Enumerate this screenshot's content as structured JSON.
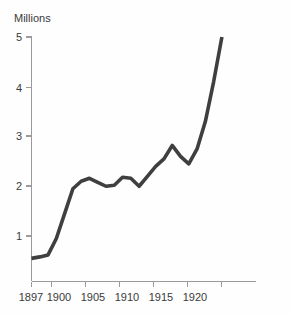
{
  "chart_data": {
    "type": "line",
    "title": "",
    "subtitle": "",
    "xlabel": "",
    "ylabel": "Millions",
    "xlim": [
      1897,
      1923
    ],
    "ylim": [
      0,
      5.4
    ],
    "grid": false,
    "legend": null,
    "line_color": "#3f3f3f",
    "axis_color": "#9a9a9a",
    "background_color": "#fefefe",
    "xticks": [
      1897,
      1900,
      1905,
      1910,
      1915,
      1920
    ],
    "xtick_labels": [
      "1897",
      "1900",
      "1905",
      "1910",
      "1915",
      "1920"
    ],
    "yticks": [
      1,
      2,
      3,
      4,
      5
    ],
    "ytick_labels": [
      "1",
      "2",
      "3",
      "4",
      "5"
    ],
    "x": [
      1897,
      1898,
      1899,
      1900,
      1901,
      1902,
      1903,
      1904,
      1905,
      1906,
      1907,
      1908,
      1909,
      1910,
      1911,
      1912,
      1913,
      1914,
      1915,
      1916,
      1917,
      1918,
      1919,
      1920
    ],
    "values": [
      0.55,
      0.58,
      0.62,
      0.95,
      1.45,
      1.95,
      2.1,
      2.16,
      2.08,
      2.0,
      2.02,
      2.18,
      2.16,
      2.0,
      2.2,
      2.4,
      2.55,
      2.82,
      2.6,
      2.45,
      2.75,
      3.3,
      4.1,
      5.0
    ],
    "series": [
      {
        "name": "Millions",
        "values": [
          0.55,
          0.58,
          0.62,
          0.95,
          1.45,
          1.95,
          2.1,
          2.16,
          2.08,
          2.0,
          2.02,
          2.18,
          2.16,
          2.0,
          2.2,
          2.4,
          2.55,
          2.82,
          2.6,
          2.45,
          2.75,
          3.3,
          4.1,
          5.0
        ]
      }
    ]
  }
}
